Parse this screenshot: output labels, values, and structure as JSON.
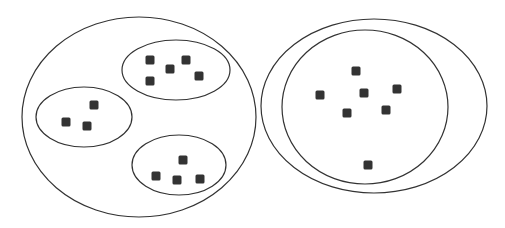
{
  "diagram": {
    "background": "#ffffff",
    "stroke_color": "#333333",
    "item_color": "#333333",
    "left_group": {
      "outer": {
        "cx": 139,
        "cy": 117,
        "rx": 117,
        "ry": 100
      },
      "clusters": [
        {
          "name": "top-right-cluster",
          "cx": 176,
          "cy": 70,
          "rx": 54,
          "ry": 30,
          "items": [
            [
              150,
              60
            ],
            [
              170,
              69
            ],
            [
              186,
              60
            ],
            [
              199,
              76
            ],
            [
              150,
              81
            ]
          ]
        },
        {
          "name": "left-cluster",
          "cx": 84,
          "cy": 117,
          "rx": 48,
          "ry": 30,
          "items": [
            [
              94,
              105
            ],
            [
              66,
              122
            ],
            [
              87,
              126
            ]
          ]
        },
        {
          "name": "bottom-cluster",
          "cx": 179,
          "cy": 165,
          "rx": 47,
          "ry": 30,
          "items": [
            [
              183,
              160
            ],
            [
              156,
              176
            ],
            [
              177,
              180
            ],
            [
              200,
              179
            ]
          ]
        }
      ]
    },
    "right_group": {
      "outer": {
        "cx": 374,
        "cy": 106,
        "rx": 113,
        "ry": 87
      },
      "inner": {
        "cx": 365,
        "cy": 107,
        "rx": 83,
        "ry": 77
      },
      "items": [
        [
          356,
          71
        ],
        [
          320,
          95
        ],
        [
          364,
          93
        ],
        [
          397,
          89
        ],
        [
          347,
          113
        ],
        [
          386,
          110
        ],
        [
          368,
          165
        ]
      ]
    },
    "item_size": 9
  }
}
